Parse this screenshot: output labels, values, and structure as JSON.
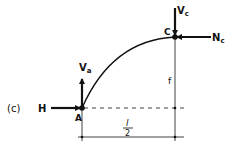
{
  "figure": {
    "panel_label": "(c)",
    "points": {
      "A": "A",
      "C": "C"
    },
    "forces": {
      "H": "H",
      "Va": {
        "main": "V",
        "sub": "a"
      },
      "Vc": {
        "main": "V",
        "sub": "c"
      },
      "Nc": {
        "main": "N",
        "sub": "c"
      }
    },
    "dimensions": {
      "rise": "f",
      "half_span_num": "l",
      "half_span_den": "2"
    },
    "colors": {
      "ink": "#111111",
      "background": "#ffffff"
    }
  }
}
